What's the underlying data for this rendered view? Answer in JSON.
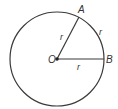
{
  "diagram": {
    "colors": {
      "stroke": "#3a3a3a",
      "text": "#333333",
      "background": "#ffffff"
    },
    "circle": {
      "cx": 57,
      "cy": 59,
      "r": 47
    },
    "points": {
      "center": {
        "label": "O",
        "x": 57,
        "y": 59
      },
      "A": {
        "label": "A",
        "x": 79,
        "y": 17
      },
      "B": {
        "label": "B",
        "x": 104,
        "y": 59
      }
    },
    "segments": [
      {
        "from": "O",
        "to": "A",
        "label": "r"
      },
      {
        "from": "O",
        "to": "B",
        "label": "r"
      }
    ],
    "arc": {
      "from": "A",
      "to": "B",
      "label": "r"
    }
  }
}
